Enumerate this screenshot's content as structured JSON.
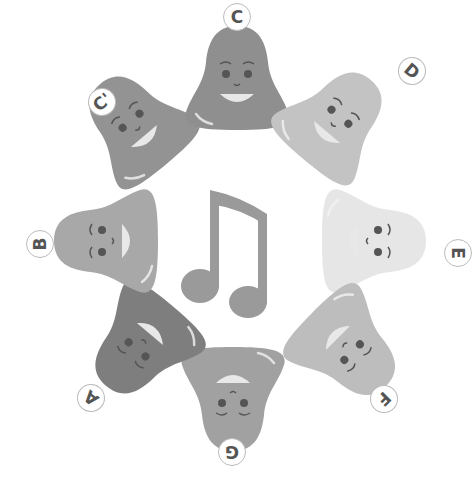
{
  "scene": {
    "description": "Ring of eight smiling bells labelled with musical notes around a music note",
    "center_icon": "music-note-icon",
    "note_color": "#9a9a9a",
    "bells": [
      {
        "id": "c-high",
        "label": "C'",
        "color": "#939393",
        "x": 78,
        "y": 68,
        "rot": -40,
        "lx": 88,
        "ly": 88,
        "lrot": -40
      },
      {
        "id": "c",
        "label": "C",
        "color": "#8f8f8f",
        "x": 182,
        "y": 22,
        "rot": 0,
        "lx": 223,
        "ly": 3,
        "lrot": 0
      },
      {
        "id": "d",
        "label": "D",
        "color": "#c3c3c3",
        "x": 283,
        "y": 64,
        "rot": 40,
        "lx": 398,
        "ly": 57,
        "lrot": 40
      },
      {
        "id": "e",
        "label": "E",
        "color": "#e6e6e6",
        "x": 320,
        "y": 186,
        "rot": 90,
        "lx": 444,
        "ly": 239,
        "lrot": 90
      },
      {
        "id": "f",
        "label": "F",
        "color": "#bdbdbd",
        "x": 295,
        "y": 295,
        "rot": 135,
        "lx": 370,
        "ly": 385,
        "lrot": 135
      },
      {
        "id": "g",
        "label": "G",
        "color": "#a1a1a1",
        "x": 178,
        "y": 345,
        "rot": 180,
        "lx": 218,
        "ly": 438,
        "lrot": 180
      },
      {
        "id": "a",
        "label": "A",
        "color": "#7e7e7e",
        "x": 84,
        "y": 292,
        "rot": 220,
        "lx": 77,
        "ly": 384,
        "lrot": 220
      },
      {
        "id": "b",
        "label": "B",
        "color": "#a8a8a8",
        "x": 50,
        "y": 186,
        "rot": 270,
        "lx": 26,
        "ly": 230,
        "lrot": 270
      }
    ]
  }
}
